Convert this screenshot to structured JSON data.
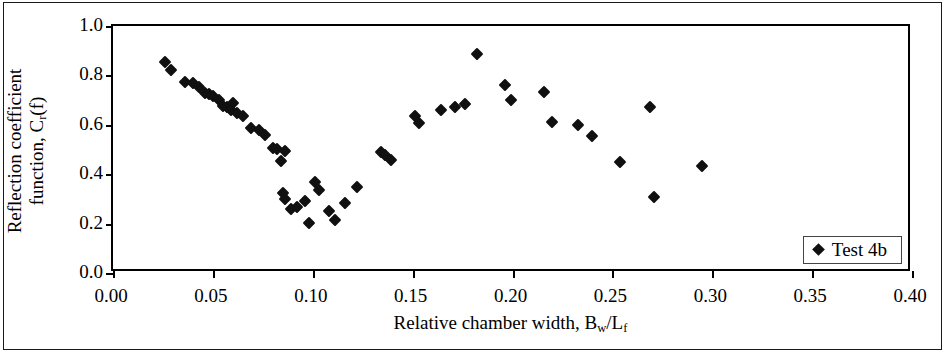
{
  "chart_data": {
    "type": "scatter",
    "title": "",
    "xlabel": "Relative chamber width, B_w/L_f",
    "xlabel_parts": {
      "prefix": "Relative chamber width, B",
      "sub1": "w",
      "mid": "/L",
      "sub2": "f"
    },
    "ylabel": "Reflection coefficient function, C_r(f)",
    "ylabel_line1": "Reflection coefficient",
    "ylabel_line2_prefix": "function, C",
    "ylabel_line2_sub": "r",
    "ylabel_line2_suffix": "(f)",
    "xlim": [
      0.0,
      0.4
    ],
    "ylim": [
      0.0,
      1.0
    ],
    "xticks": [
      0.0,
      0.05,
      0.1,
      0.15,
      0.2,
      0.25,
      0.3,
      0.35,
      0.4
    ],
    "xtick_labels": [
      "0.00",
      "0.05",
      "0.10",
      "0.15",
      "0.20",
      "0.25",
      "0.30",
      "0.35",
      "0.40"
    ],
    "yticks": [
      0.0,
      0.2,
      0.4,
      0.6,
      0.8,
      1.0
    ],
    "ytick_labels": [
      "0.0",
      "0.2",
      "0.4",
      "0.6",
      "0.8",
      "1.0"
    ],
    "grid": false,
    "legend_position": "bottom-right",
    "marker": "diamond",
    "marker_color": "#101010",
    "series": [
      {
        "name": "Test 4b",
        "points": [
          [
            0.026,
            0.855
          ],
          [
            0.029,
            0.82
          ],
          [
            0.036,
            0.775
          ],
          [
            0.04,
            0.77
          ],
          [
            0.043,
            0.755
          ],
          [
            0.046,
            0.73
          ],
          [
            0.048,
            0.725
          ],
          [
            0.05,
            0.718
          ],
          [
            0.053,
            0.7
          ],
          [
            0.055,
            0.678
          ],
          [
            0.057,
            0.672
          ],
          [
            0.059,
            0.66
          ],
          [
            0.06,
            0.69
          ],
          [
            0.062,
            0.648
          ],
          [
            0.065,
            0.635
          ],
          [
            0.069,
            0.588
          ],
          [
            0.073,
            0.578
          ],
          [
            0.076,
            0.56
          ],
          [
            0.08,
            0.508
          ],
          [
            0.082,
            0.502
          ],
          [
            0.084,
            0.455
          ],
          [
            0.086,
            0.492
          ],
          [
            0.085,
            0.325
          ],
          [
            0.086,
            0.3
          ],
          [
            0.089,
            0.258
          ],
          [
            0.092,
            0.268
          ],
          [
            0.096,
            0.29
          ],
          [
            0.098,
            0.203
          ],
          [
            0.101,
            0.368
          ],
          [
            0.103,
            0.335
          ],
          [
            0.108,
            0.252
          ],
          [
            0.111,
            0.213
          ],
          [
            0.116,
            0.285
          ],
          [
            0.122,
            0.35
          ],
          [
            0.134,
            0.49
          ],
          [
            0.136,
            0.478
          ],
          [
            0.139,
            0.458
          ],
          [
            0.151,
            0.635
          ],
          [
            0.153,
            0.608
          ],
          [
            0.164,
            0.658
          ],
          [
            0.171,
            0.672
          ],
          [
            0.176,
            0.683
          ],
          [
            0.182,
            0.888
          ],
          [
            0.196,
            0.762
          ],
          [
            0.199,
            0.702
          ],
          [
            0.216,
            0.733
          ],
          [
            0.22,
            0.612
          ],
          [
            0.233,
            0.598
          ],
          [
            0.24,
            0.553
          ],
          [
            0.254,
            0.448
          ],
          [
            0.269,
            0.672
          ],
          [
            0.271,
            0.308
          ],
          [
            0.295,
            0.432
          ]
        ]
      }
    ]
  },
  "legend": {
    "items": [
      {
        "label": "Test 4b",
        "marker": "diamond",
        "color": "#101010"
      }
    ]
  }
}
